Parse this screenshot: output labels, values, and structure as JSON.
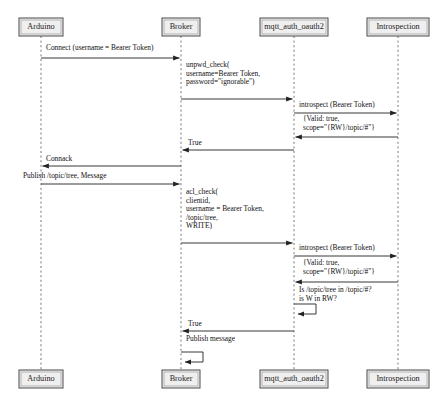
{
  "caption_clipped": "Figure: MQTT OAuth2 token introspection sequence",
  "diagram": {
    "type": "uml-sequence-diagram",
    "width": 441,
    "height": 405,
    "colors": {
      "actor_fill": "#efefef",
      "actor_stroke": "#4a4a4a",
      "lifeline": "#666666",
      "arrow": "#222222",
      "background": "#ffffff"
    },
    "actors": [
      {
        "id": "arduino",
        "label": "Arduino",
        "x": 41,
        "box_w": 44
      },
      {
        "id": "broker",
        "label": "Broker",
        "x": 181,
        "box_w": 38
      },
      {
        "id": "mqtt_auth",
        "label": "mqtt_auth_oauth2",
        "x": 294,
        "box_w": 68
      },
      {
        "id": "introspection",
        "label": "Introspection",
        "x": 398,
        "box_w": 62
      }
    ],
    "messages": [
      {
        "id": "m1",
        "from": "arduino",
        "to": "broker",
        "y": 58,
        "direction": "right",
        "label_x": 46,
        "label_y": 50,
        "lines": [
          "Connect (username = Bearer Token)"
        ]
      },
      {
        "id": "m2",
        "from": "broker",
        "to": "mqtt_auth",
        "y": 99,
        "direction": "right",
        "label_x": 186,
        "label_y": 67,
        "lines": [
          "unpwd_check(",
          "username=Bearer Token,",
          "password=\"ignorable\")"
        ]
      },
      {
        "id": "m3",
        "from": "mqtt_auth",
        "to": "introspection",
        "y": 113,
        "direction": "right",
        "label_x": 299,
        "label_y": 107,
        "lines": [
          "introspect (Bearer Token)"
        ]
      },
      {
        "id": "m4",
        "from": "introspection",
        "to": "mqtt_auth",
        "y": 137,
        "direction": "left",
        "label_x": 303,
        "label_y": 121,
        "lines": [
          "{Valid: true,",
          "scope=\"{RW}/topic/#\"}"
        ]
      },
      {
        "id": "m5",
        "from": "mqtt_auth",
        "to": "broker",
        "y": 150,
        "direction": "left",
        "label_x": 188,
        "label_y": 145,
        "lines": [
          "True"
        ]
      },
      {
        "id": "m6",
        "from": "broker",
        "to": "arduino",
        "y": 166,
        "direction": "left",
        "label_x": 46,
        "label_y": 161,
        "lines": [
          "Connack"
        ]
      },
      {
        "id": "m7",
        "from": "arduino",
        "to": "broker",
        "y": 184,
        "direction": "right",
        "label_x": 23,
        "label_y": 178,
        "lines": [
          "Publish /topic/tree, Message"
        ]
      },
      {
        "id": "m8",
        "from": "broker",
        "to": "mqtt_auth",
        "y": 243,
        "direction": "right",
        "label_x": 186,
        "label_y": 194,
        "lines": [
          "acl_check(",
          "   clientid,",
          "   username = Bearer Token,",
          "   /topic/tree,",
          "   WRITE)"
        ]
      },
      {
        "id": "m9",
        "from": "mqtt_auth",
        "to": "introspection",
        "y": 256,
        "direction": "right",
        "label_x": 299,
        "label_y": 250,
        "lines": [
          "introspect (Bearer Token)"
        ]
      },
      {
        "id": "m10",
        "from": "introspection",
        "to": "mqtt_auth",
        "y": 282,
        "direction": "left",
        "label_x": 303,
        "label_y": 265,
        "lines": [
          "{Valid: true,",
          "scope=\"{RW}/topic/#\"}"
        ]
      },
      {
        "id": "m11",
        "from": "mqtt_auth",
        "to": "mqtt_auth",
        "y": 292,
        "direction": "self",
        "label_x": 299,
        "label_y": 292,
        "self_top": 304,
        "self_bottom": 314,
        "self_width": 22,
        "lines": [
          "Is /topic/tree in /topic/#?",
          "is W in RW?"
        ]
      },
      {
        "id": "m12",
        "from": "mqtt_auth",
        "to": "broker",
        "y": 331,
        "direction": "left",
        "label_x": 188,
        "label_y": 326,
        "lines": [
          "True"
        ]
      },
      {
        "id": "m13",
        "from": "broker",
        "to": "broker",
        "y": 341,
        "direction": "self",
        "label_x": 186,
        "label_y": 341,
        "self_top": 352,
        "self_bottom": 362,
        "self_width": 22,
        "lines": [
          "Publish message"
        ]
      }
    ],
    "box_top_y": 18,
    "box_bottom_y": 370,
    "box_h": 18
  }
}
